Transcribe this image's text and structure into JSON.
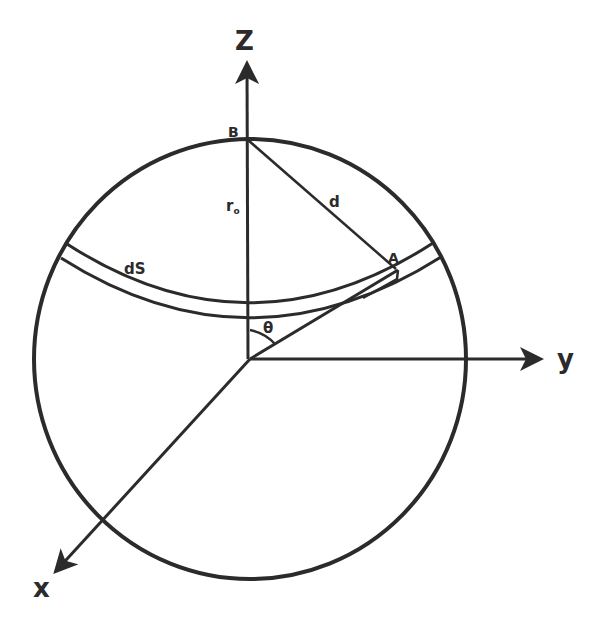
{
  "diagram": {
    "type": "sphere-geometry",
    "colors": {
      "stroke": "#2b2b2b",
      "background": "#ffffff"
    },
    "axes": {
      "z": {
        "label": "Z"
      },
      "y": {
        "label": "y"
      },
      "x": {
        "label": "x"
      }
    },
    "points": {
      "B": {
        "label": "B"
      },
      "A": {
        "label": "A"
      }
    },
    "labels": {
      "radius": "r",
      "radius_subscript": "o",
      "distance": "d",
      "surface_element": "dS",
      "angle": "θ"
    }
  }
}
